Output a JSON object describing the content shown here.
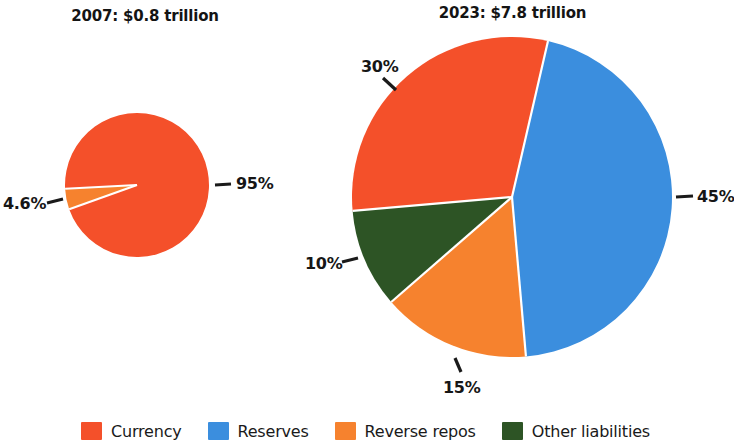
{
  "charts": {
    "left": {
      "title": "2007: $0.8 trillion",
      "labels": {
        "currency": "95%",
        "reverse_repos": "4.6%"
      }
    },
    "right": {
      "title": "2023: $7.8 trillion",
      "labels": {
        "reserves": "45%",
        "reverse_repos": "15%",
        "other_liabilities": "10%",
        "currency": "30%"
      }
    }
  },
  "legend": {
    "items": [
      {
        "label": "Currency",
        "color": "#F4502A"
      },
      {
        "label": "Reserves",
        "color": "#3B8EDE"
      },
      {
        "label": "Reverse repos",
        "color": "#F6822E"
      },
      {
        "label": "Other liabilities",
        "color": "#2D5425"
      }
    ]
  },
  "colors": {
    "currency": "#F4502A",
    "reserves": "#3B8EDE",
    "reverse_repos": "#F6822E",
    "other_liabilities": "#2D5425",
    "separator": "#FFFFFF",
    "leader_line": "#1a1a1a"
  },
  "chart_data": [
    {
      "type": "pie",
      "title": "2007: $0.8 trillion",
      "total_label": "$0.8 trillion",
      "year": 2007,
      "categories": [
        "Currency",
        "Reverse repos"
      ],
      "values": [
        95,
        4.6
      ],
      "value_labels": [
        "95%",
        "4.6%"
      ],
      "colors": [
        "#F4502A",
        "#F6822E"
      ],
      "units": "percent of total liabilities",
      "legend_position": "bottom",
      "geometry": {
        "cx": 137,
        "cy": 185,
        "r": 72,
        "start_angle_deg": 177,
        "direction": "clockwise"
      }
    },
    {
      "type": "pie",
      "title": "2023: $7.8 trillion",
      "total_label": "$7.8 trillion",
      "year": 2023,
      "categories": [
        "Reserves",
        "Reverse repos",
        "Other liabilities",
        "Currency"
      ],
      "values": [
        45,
        15,
        10,
        30
      ],
      "value_labels": [
        "45%",
        "15%",
        "10%",
        "30%"
      ],
      "colors": [
        "#3B8EDE",
        "#F6822E",
        "#2D5425",
        "#F4502A"
      ],
      "units": "percent of total liabilities",
      "legend_position": "bottom",
      "geometry": {
        "cx": 512,
        "cy": 197,
        "r": 160,
        "start_angle_deg": -77,
        "direction": "clockwise"
      }
    }
  ]
}
